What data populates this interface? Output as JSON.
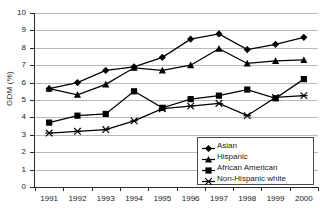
{
  "chart_data": {
    "type": "line",
    "title": "",
    "xlabel": "",
    "ylabel": "GDM (%)",
    "categories": [
      "1991",
      "1992",
      "1993",
      "1994",
      "1995",
      "1996",
      "1997",
      "1998",
      "1999",
      "2000"
    ],
    "x": [
      1991,
      1992,
      1993,
      1994,
      1995,
      1996,
      1997,
      1998,
      1999,
      2000
    ],
    "ylim": [
      0,
      10
    ],
    "yticks": [
      0,
      1,
      2,
      3,
      4,
      5,
      6,
      7,
      8,
      9,
      10
    ],
    "ytick_labels": [
      "0",
      "1",
      "2",
      "3",
      "4",
      "5",
      "6",
      "7",
      "8",
      "9",
      "10"
    ],
    "grid": "horizontal",
    "legend_position": "inside-bottom-right",
    "series": [
      {
        "name": "Asian",
        "marker": "diamond",
        "color": "#000000",
        "values": [
          5.65,
          6.0,
          6.7,
          6.9,
          7.45,
          8.5,
          8.8,
          7.9,
          8.2,
          8.6
        ]
      },
      {
        "name": "Hispanic",
        "marker": "triangle",
        "color": "#000000",
        "values": [
          5.65,
          5.3,
          5.9,
          6.85,
          6.7,
          7.0,
          7.95,
          7.1,
          7.25,
          7.3
        ]
      },
      {
        "name": "African American",
        "marker": "square",
        "color": "#000000",
        "values": [
          3.7,
          4.1,
          4.2,
          5.5,
          4.55,
          5.05,
          5.25,
          5.6,
          5.1,
          6.2
        ]
      },
      {
        "name": "Non-Hispanic white",
        "marker": "x-star",
        "color": "#000000",
        "values": [
          3.1,
          3.2,
          3.3,
          3.8,
          4.5,
          4.65,
          4.8,
          4.1,
          5.15,
          5.25
        ]
      }
    ]
  },
  "legend": {
    "items": [
      {
        "label": "Asian",
        "marker": "diamond"
      },
      {
        "label": "Hispanic",
        "marker": "triangle"
      },
      {
        "label": "African American",
        "marker": "square"
      },
      {
        "label": "Non-Hispanic white",
        "marker": "x-star"
      }
    ]
  }
}
